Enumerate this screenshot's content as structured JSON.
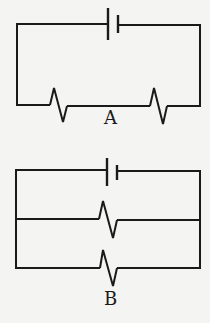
{
  "diagram": {
    "type": "circuit-diagrams",
    "stroke_color": "#1a1a1a",
    "background_color": "#f4f4f2",
    "circuits": [
      {
        "label": "A",
        "configuration": "series",
        "components": [
          {
            "type": "battery",
            "position": "top"
          },
          {
            "type": "resistor",
            "position": "bottom-left"
          },
          {
            "type": "resistor",
            "position": "bottom-right"
          }
        ]
      },
      {
        "label": "B",
        "configuration": "parallel",
        "components": [
          {
            "type": "battery",
            "position": "top"
          },
          {
            "type": "resistor",
            "position": "middle-branch"
          },
          {
            "type": "resistor",
            "position": "bottom-branch"
          }
        ]
      }
    ]
  }
}
